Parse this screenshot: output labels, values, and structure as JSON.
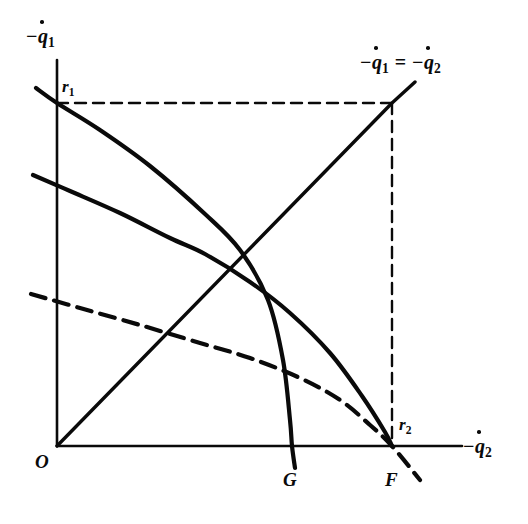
{
  "figure": {
    "type": "line-diagram",
    "background_color": "#ffffff",
    "ink_color": "#0a0a0a",
    "axes": {
      "y_axis_label": "−q̇₁",
      "x_axis_label": "−q̇₂",
      "origin_label": "O"
    },
    "labels": {
      "r1": "r",
      "r1_sub": "1",
      "r2": "r",
      "r2_sub": "2",
      "origin": "O",
      "g": "G",
      "f": "F",
      "diagonal_neg1": "−",
      "diagonal_q": "q",
      "diagonal_sub1": "1",
      "diagonal_equals": "=",
      "diagonal_neg2": "−",
      "diagonal_sub2": "2",
      "axis_neg": "−",
      "axis_q": "q",
      "y_sub": "1",
      "x_sub": "2"
    }
  },
  "chart_data": {
    "type": "line",
    "title": "",
    "xlabel": "−q̇₂",
    "ylabel": "−q̇₁",
    "xlim": [
      0,
      462
    ],
    "ylim": [
      0,
      446
    ],
    "grid": false,
    "legend": "none",
    "annotations": [
      {
        "text": "O",
        "x": 57,
        "y": 446,
        "role": "origin"
      },
      {
        "text": "r₁",
        "x": 57,
        "y": 103,
        "role": "y-intercept-of-curve-1"
      },
      {
        "text": "r₂",
        "x": 392,
        "y": 446,
        "role": "x-intercept-at-F"
      },
      {
        "text": "G",
        "x": 292,
        "y": 446,
        "role": "x-intercept-of-curve-1"
      },
      {
        "text": "F",
        "x": 392,
        "y": 446,
        "role": "x-intercept-of-curve-2-and-dashed"
      },
      {
        "text": "−q̇₁ = −q̇₂",
        "x": 415,
        "y": 82,
        "role": "45-degree-ray-label"
      }
    ],
    "series": [
      {
        "name": "curve-r1-G",
        "style": "solid",
        "linewidth": 4.2,
        "points": [
          [
            36,
            88
          ],
          [
            57,
            103
          ],
          [
            100,
            130
          ],
          [
            150,
            166
          ],
          [
            205,
            214
          ],
          [
            240,
            250
          ],
          [
            268,
            300
          ],
          [
            283,
            360
          ],
          [
            290,
            420
          ],
          [
            292,
            446
          ],
          [
            295,
            468
          ]
        ]
      },
      {
        "name": "curve-to-F",
        "style": "solid",
        "linewidth": 4.2,
        "points": [
          [
            33,
            175
          ],
          [
            70,
            191
          ],
          [
            120,
            213
          ],
          [
            170,
            238
          ],
          [
            205,
            254
          ],
          [
            250,
            282
          ],
          [
            290,
            313
          ],
          [
            330,
            353
          ],
          [
            362,
            396
          ],
          [
            385,
            432
          ],
          [
            392,
            446
          ]
        ]
      },
      {
        "name": "dashed-curve-to-F",
        "style": "dashed",
        "linewidth": 4.2,
        "points": [
          [
            31,
            294
          ],
          [
            80,
            308
          ],
          [
            140,
            325
          ],
          [
            200,
            343
          ],
          [
            250,
            358
          ],
          [
            300,
            378
          ],
          [
            340,
            400
          ],
          [
            370,
            425
          ],
          [
            392,
            446
          ],
          [
            420,
            480
          ]
        ]
      },
      {
        "name": "diagonal-ray-45deg",
        "style": "solid",
        "linewidth": 3.4,
        "points": [
          [
            57,
            446
          ],
          [
            392,
            103
          ],
          [
            415,
            82
          ]
        ]
      },
      {
        "name": "dashed-horizontal-r1",
        "style": "dashed",
        "linewidth": 2.4,
        "points": [
          [
            57,
            103
          ],
          [
            392,
            103
          ]
        ]
      },
      {
        "name": "dashed-vertical-F",
        "style": "dashed",
        "linewidth": 2.4,
        "points": [
          [
            392,
            103
          ],
          [
            392,
            446
          ]
        ]
      },
      {
        "name": "y-axis",
        "style": "solid",
        "linewidth": 2.6,
        "points": [
          [
            57,
            60
          ],
          [
            57,
            446
          ]
        ]
      },
      {
        "name": "x-axis",
        "style": "solid",
        "linewidth": 2.6,
        "points": [
          [
            57,
            446
          ],
          [
            462,
            446
          ]
        ]
      }
    ]
  }
}
